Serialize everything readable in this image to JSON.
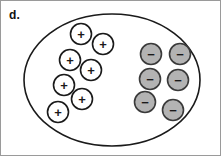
{
  "figure": {
    "panel_label": "d.",
    "caption_alt": "Oval containing seven positive charges on the left and six negative charges on the right",
    "colors": {
      "background": "#ffffff",
      "outline": "#1a1a1a",
      "positive_fill": "#ffffff",
      "positive_stroke": "#1a1a1a",
      "positive_symbol_color": "#1a1a1a",
      "negative_fill": "#b3b3b3",
      "negative_stroke": "#3a3a3a",
      "negative_symbol_color": "#1a1a1a",
      "frame_border": "#9a9a9a"
    },
    "container": {
      "shape": "ellipse",
      "cx": 111,
      "cy": 79,
      "rx": 88,
      "ry": 66,
      "stroke_width": 1.6
    },
    "charge_radius": 10.5,
    "positive_charges": {
      "symbol": "+",
      "count": 7,
      "items": [
        {
          "id": "pos-1",
          "cx": 80,
          "cy": 33
        },
        {
          "id": "pos-2",
          "cx": 102,
          "cy": 43
        },
        {
          "id": "pos-3",
          "cx": 69,
          "cy": 59
        },
        {
          "id": "pos-4",
          "cx": 90,
          "cy": 69
        },
        {
          "id": "pos-5",
          "cx": 63,
          "cy": 84
        },
        {
          "id": "pos-6",
          "cx": 81,
          "cy": 98
        },
        {
          "id": "pos-7",
          "cx": 57,
          "cy": 111
        }
      ]
    },
    "negative_charges": {
      "symbol": "−",
      "count": 6,
      "items": [
        {
          "id": "neg-1",
          "cx": 150,
          "cy": 53
        },
        {
          "id": "neg-2",
          "cx": 179,
          "cy": 53
        },
        {
          "id": "neg-3",
          "cx": 149,
          "cy": 78
        },
        {
          "id": "neg-4",
          "cx": 177,
          "cy": 79
        },
        {
          "id": "neg-5",
          "cx": 144,
          "cy": 101
        },
        {
          "id": "neg-6",
          "cx": 172,
          "cy": 109
        }
      ]
    }
  }
}
